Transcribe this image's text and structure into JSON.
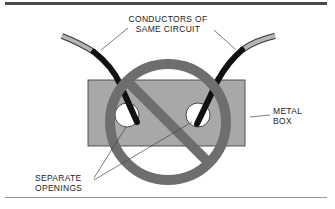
{
  "diagram": {
    "labels": {
      "conductors_line1": "CONDUCTORS OF",
      "conductors_line2": "SAME CIRCUIT",
      "metal_box_line1": "METAL",
      "metal_box_line2": "BOX",
      "openings_line1": "SEPARATE",
      "openings_line2": "OPENINGS"
    },
    "colors": {
      "box_fill": "#a8a8a8",
      "prohibition_sign": "#6e6e6e",
      "conductor_insulation": "#111111",
      "conductor_outer_jacket": "#b5b5b5",
      "opening_fill": "#ffffff"
    },
    "meaning": "Prohibited: conductors of the same circuit passing through separate openings in a metal box"
  }
}
